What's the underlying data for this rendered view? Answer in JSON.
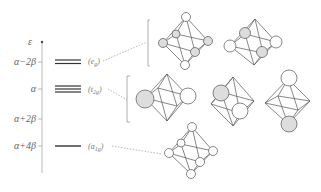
{
  "axis": {
    "symbol": "ε",
    "ticks": [
      {
        "label": "α−2β",
        "y": 62
      },
      {
        "label": "α",
        "y": 89
      },
      {
        "label": "α+2β",
        "y": 119
      },
      {
        "label": "α+4β",
        "y": 146
      }
    ]
  },
  "levels": [
    {
      "name": "eg",
      "label": "(e",
      "sub": "g",
      "close": ")",
      "energy": "α−2β",
      "degeneracy": 2,
      "y": 62
    },
    {
      "name": "t2g",
      "label": "(t",
      "sub": "2g",
      "close": ")",
      "energy": "α",
      "degeneracy": 3,
      "y": 89
    },
    {
      "name": "a1g",
      "label": "(a",
      "sub": "1g",
      "close": ")",
      "energy": "α+4β",
      "degeneracy": 1,
      "y": 146
    }
  ],
  "colors": {
    "line": "#444444",
    "axis": "#999999",
    "shaded": "#dddddd",
    "open": "#ffffff",
    "dashed": "#888888"
  }
}
